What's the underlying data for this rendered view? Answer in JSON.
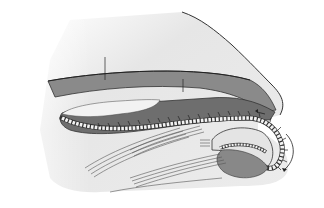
{
  "figure": {
    "panel_label": "(a)",
    "labels": {
      "esophagus": "Esophagus",
      "radula": "Radula",
      "radula_sac": "Radula sac",
      "mouth": "Mouth",
      "muscles": "Muscles",
      "odontophore_line1": "Odontophore",
      "odontophore_line2": "cartilage"
    },
    "colors": {
      "body_fill": "#e8e8e8",
      "dark_tissue": "#7a7a7a",
      "outline": "#333333",
      "cartilage": "#d9d9d9",
      "teeth": "#f2f2f2"
    }
  }
}
